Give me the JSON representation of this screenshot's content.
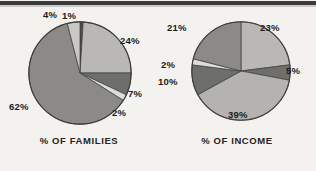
{
  "figure": {
    "background_color": "#f3f2ee",
    "rule_color": "#3a3a38"
  },
  "panels": [
    {
      "id": "families",
      "caption": "% OF FAMILIES",
      "labels": [
        {
          "text": "4%",
          "x": 43,
          "y": 0
        },
        {
          "text": "1%",
          "x": 62,
          "y": 1
        },
        {
          "text": "24%",
          "x": 120,
          "y": 26
        },
        {
          "text": "7%",
          "x": 128,
          "y": 79
        },
        {
          "text": "2%",
          "x": 112,
          "y": 98
        },
        {
          "text": "62%",
          "x": 9,
          "y": 92
        }
      ]
    },
    {
      "id": "income",
      "caption": "% OF INCOME",
      "labels": [
        {
          "text": "23%",
          "x": 102,
          "y": 13
        },
        {
          "text": "5%",
          "x": 128,
          "y": 56
        },
        {
          "text": "39%",
          "x": 70,
          "y": 100
        },
        {
          "text": "10%",
          "x": 0,
          "y": 67
        },
        {
          "text": "2%",
          "x": 3,
          "y": 50
        },
        {
          "text": "21%",
          "x": 9,
          "y": 13
        }
      ]
    }
  ],
  "chart_data": [
    {
      "type": "pie",
      "title": "% OF FAMILIES",
      "categories": [
        "1%",
        "24%",
        "7%",
        "2%",
        "62%",
        "4%"
      ],
      "values": [
        1,
        24,
        7,
        2,
        62,
        4
      ],
      "labels": [
        "1%",
        "24%",
        "7%",
        "2%",
        "62%",
        "4%"
      ],
      "colors": [
        "#4e4e4c",
        "#b9b8b4",
        "#6e6e6b",
        "#dedcd7",
        "#8b8a87",
        "#c9c8c4"
      ],
      "start_angle_deg": 0,
      "direction": "clockwise",
      "legend": "none",
      "grid": false
    },
    {
      "type": "pie",
      "title": "% OF INCOME",
      "categories": [
        "23%",
        "5%",
        "39%",
        "10%",
        "2%",
        "21%"
      ],
      "values": [
        23,
        5,
        39,
        10,
        2,
        21
      ],
      "labels": [
        "23%",
        "5%",
        "39%",
        "10%",
        "2%",
        "21%"
      ],
      "colors": [
        "#b9b8b4",
        "#6e6e6b",
        "#b4b3af",
        "#6e6e6b",
        "#dedcd7",
        "#8b8a87"
      ],
      "start_angle_deg": 0,
      "direction": "clockwise",
      "legend": "none",
      "grid": false
    }
  ]
}
